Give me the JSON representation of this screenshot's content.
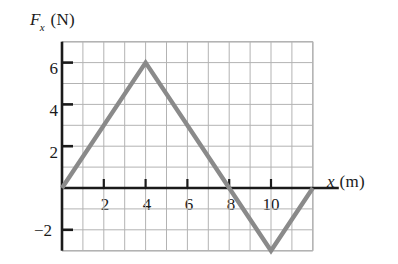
{
  "axes": {
    "y_axis_label_symbol": "F",
    "y_axis_label_subscript": "x",
    "y_axis_label_unit": "(N)",
    "x_axis_label_symbol": "x",
    "x_axis_label_unit": "(m)",
    "y_ticks": [
      "6",
      "4",
      "2",
      "−2"
    ],
    "x_ticks": [
      "2",
      "4",
      "6",
      "8",
      "10"
    ]
  },
  "colors": {
    "line": "#8a8a8a",
    "axis": "#1a1a1a",
    "grid": "#b3b3b3",
    "text": "#1a1a1a",
    "background": "#ffffff"
  },
  "chart_data": {
    "type": "line",
    "title": "",
    "xlabel": "x (m)",
    "ylabel": "Fx (N)",
    "xlim": [
      0,
      12
    ],
    "ylim": [
      -3,
      7
    ],
    "grid": true,
    "grid_spacing_x": 1,
    "grid_spacing_y": 1,
    "legend": null,
    "xticks": [
      2,
      4,
      6,
      8,
      10
    ],
    "yticks": [
      -2,
      2,
      4,
      6
    ],
    "series": [
      {
        "name": "Fx(x)",
        "x": [
          0,
          4,
          8,
          10,
          12
        ],
        "y": [
          0,
          6,
          0,
          -3,
          0
        ]
      }
    ],
    "annotations": []
  }
}
